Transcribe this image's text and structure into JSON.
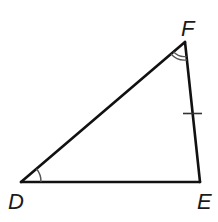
{
  "diagram": {
    "type": "triangle",
    "vertices": {
      "D": {
        "label": "D",
        "x": 21,
        "y": 182
      },
      "E": {
        "label": "E",
        "x": 200,
        "y": 182
      },
      "F": {
        "label": "F",
        "x": 185,
        "y": 42
      }
    },
    "sides": [
      {
        "from": "D",
        "to": "E"
      },
      {
        "from": "E",
        "to": "F",
        "tick_marks": 1
      },
      {
        "from": "F",
        "to": "D"
      }
    ],
    "angle_marks": [
      {
        "vertex": "D",
        "arcs": 1
      },
      {
        "vertex": "F",
        "arcs": 2
      }
    ],
    "colors": {
      "stroke": "#111111",
      "arc": "#555555",
      "background": "#ffffff"
    }
  }
}
